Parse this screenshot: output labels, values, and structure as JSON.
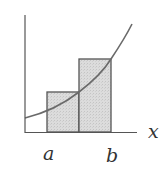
{
  "diagram": {
    "labels": {
      "x_axis": "x",
      "left_endpoint": "a",
      "right_endpoint": "b"
    },
    "colors": {
      "axis": "#555555",
      "curve": "#6a6a6a",
      "rect_fill": "#d9d9d9",
      "rect_stroke": "#555555",
      "text": "#333333"
    },
    "rectangles": [
      {
        "name": "left-rectangle",
        "x0": 47,
        "x1": 79,
        "top": 92
      },
      {
        "name": "right-rectangle",
        "x0": 79,
        "x1": 111,
        "top": 59
      }
    ]
  }
}
